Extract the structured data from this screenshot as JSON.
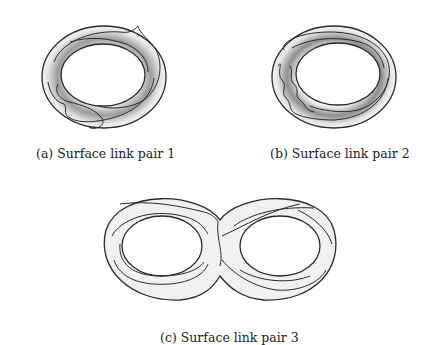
{
  "figure": {
    "subfigures": [
      {
        "id": "a",
        "caption": "(a) Surface link pair 1",
        "shape": "torus-annulus"
      },
      {
        "id": "b",
        "caption": "(b) Surface link pair 2",
        "shape": "torus-annulus"
      },
      {
        "id": "c",
        "caption": "(c) Surface link pair 3",
        "shape": "genus-2-surface"
      }
    ],
    "colors": {
      "stroke": "#2a2a2a",
      "shade_dark": "#9a9a9a",
      "shade_light": "#f2f2f2"
    }
  }
}
